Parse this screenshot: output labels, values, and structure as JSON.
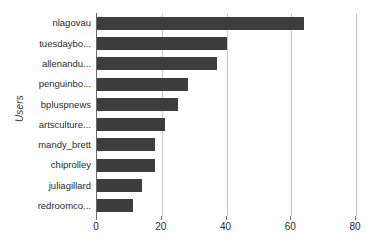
{
  "chart_data": {
    "type": "bar",
    "orientation": "horizontal",
    "title": "",
    "xlabel": "",
    "ylabel": "Users",
    "xlim": [
      0,
      80
    ],
    "ylim": null,
    "grid": true,
    "legend": false,
    "legend_position": "none",
    "bar_color": "#3d3d3d",
    "gridline_color": "#c9c9c9",
    "axis_color": "#6b6b6b",
    "xticks": [
      0,
      20,
      40,
      60,
      80
    ],
    "xticklabels": [
      "0",
      "20",
      "40",
      "60",
      "80"
    ],
    "categories": [
      "nlagovau",
      "tuesdaybo...",
      "allenandu...",
      "penguinbo...",
      "bpluspnews",
      "artsculture...",
      "mandy_brett",
      "chiprolley",
      "juliagillard",
      "redroomco..."
    ],
    "values": [
      64,
      40,
      37,
      28,
      25,
      21,
      18,
      18,
      14,
      11
    ]
  }
}
